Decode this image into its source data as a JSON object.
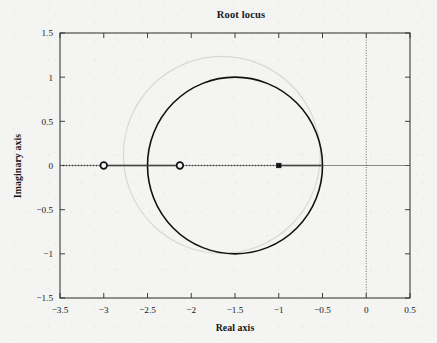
{
  "chart_data": {
    "type": "line",
    "title": "Root locus",
    "xlabel": "Real axis",
    "ylabel": "Imaginary axis",
    "xlim": [
      -3.5,
      0.5
    ],
    "ylim": [
      -1.5,
      1.5
    ],
    "grid": false,
    "legend": null,
    "xticks": [
      -3.5,
      -3,
      -2.5,
      -2,
      -1.5,
      -1,
      -0.5,
      0,
      0.5
    ],
    "xtick_labels": [
      "-3.5",
      "-3",
      "-2.5",
      "-2",
      "-1.5",
      "-1",
      "-0.5",
      "0",
      "0.5"
    ],
    "yticks": [
      -1.5,
      -1,
      -0.5,
      0,
      0.5,
      1,
      1.5
    ],
    "ytick_labels": [
      "-1.5",
      "-1",
      "-0.5",
      "0",
      "0.5",
      "1",
      "1.5"
    ],
    "series": [
      {
        "name": "locus-circle",
        "kind": "circle",
        "center": [
          -1.5,
          0
        ],
        "radius": 1.0,
        "style": "solid",
        "color": "#111111",
        "width": 1.6
      },
      {
        "name": "real-axis-locus-solid-left",
        "kind": "segment",
        "from": [
          -3.0,
          0
        ],
        "to": [
          -2.13,
          0
        ],
        "style": "solid",
        "color": "#111111",
        "width": 1.7
      },
      {
        "name": "real-axis-locus-solid-right",
        "kind": "segment",
        "from": [
          -1.0,
          0
        ],
        "to": [
          -0.5,
          0
        ],
        "style": "solid",
        "color": "#111111",
        "width": 1.7
      },
      {
        "name": "real-axis-dotted-far-left",
        "kind": "segment",
        "from": [
          -3.5,
          0
        ],
        "to": [
          -3.0,
          0
        ],
        "style": "dotted",
        "color": "#111111",
        "width": 1.4
      },
      {
        "name": "real-axis-dotted-middle",
        "kind": "segment",
        "from": [
          -2.13,
          0
        ],
        "to": [
          -1.0,
          0
        ],
        "style": "dotted",
        "color": "#111111",
        "width": 1.4
      },
      {
        "name": "real-axis-line",
        "kind": "segment",
        "from": [
          -3.5,
          0
        ],
        "to": [
          0.5,
          0
        ],
        "style": "thin-solid",
        "color": "#5a5a5a",
        "width": 0.7
      },
      {
        "name": "imaginary-axis-line",
        "kind": "segment",
        "from": [
          0,
          -1.5
        ],
        "to": [
          0,
          1.5
        ],
        "style": "dotted",
        "color": "#4a4a4a",
        "width": 0.9
      }
    ],
    "markers": [
      {
        "name": "zero",
        "symbol": "open-circle",
        "x": -3.0,
        "y": 0
      },
      {
        "name": "zero",
        "symbol": "open-circle",
        "x": -2.13,
        "y": 0
      },
      {
        "name": "breakaway-point",
        "symbol": "filled-square",
        "x": -1.0,
        "y": 0
      }
    ],
    "ghost": {
      "name": "page-bleed-circle",
      "center": [
        -1.65,
        0.12
      ],
      "radius": 1.12,
      "color": "#d8d8d6"
    },
    "colors": {
      "foreground": "#111111",
      "frame": "#2a2a2a",
      "background": "#f4f4f2",
      "ghost": "#d8d8d6"
    }
  },
  "layout": {
    "plot_left": 60,
    "plot_right": 410,
    "plot_top": 33,
    "plot_bottom": 298
  }
}
